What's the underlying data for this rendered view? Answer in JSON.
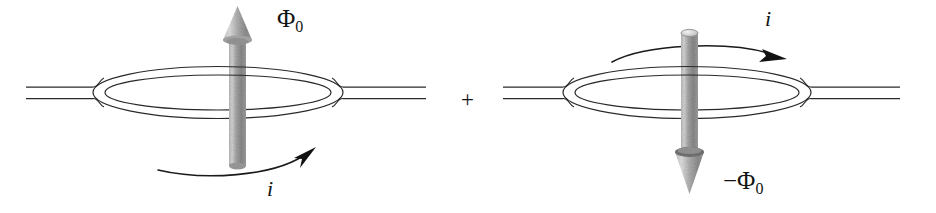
{
  "figure": {
    "name": "flux-qubit-superposition",
    "width": 936,
    "height": 213,
    "background": "#ffffff",
    "ink_color": "#141414",
    "arrow_body_color": "#9a9a9a",
    "arrow_light_color": "#d8d8d8",
    "arrow_dark_color": "#6e6e6e"
  },
  "operator": {
    "plus_label": "+"
  },
  "diagrams": [
    {
      "id": "left",
      "name": "ring-flux-up",
      "flux": {
        "label_prefix": "",
        "symbol": "Φ",
        "subscript": "0",
        "direction": "up"
      },
      "current": {
        "label": "i",
        "direction": "counterclockwise-viewed-from-above",
        "arc_position": "below-ring"
      }
    },
    {
      "id": "right",
      "name": "ring-flux-down",
      "flux": {
        "label_prefix": "−",
        "symbol": "Φ",
        "subscript": "0",
        "direction": "down"
      },
      "current": {
        "label": "i",
        "direction": "clockwise-viewed-from-above",
        "arc_position": "above-ring"
      }
    }
  ]
}
